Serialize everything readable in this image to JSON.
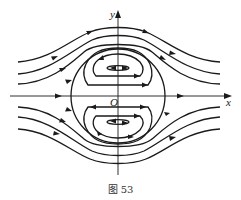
{
  "figure": {
    "caption": "图 53",
    "axes": {
      "x_label": "x",
      "y_label": "y",
      "origin_label": "O"
    },
    "colors": {
      "stroke": "#1a1a1a",
      "background": "#ffffff"
    }
  }
}
